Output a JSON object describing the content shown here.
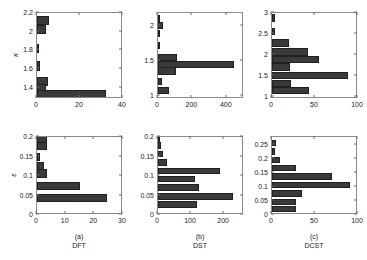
{
  "figure": {
    "layout": "2 rows x 3 columns of horizontal bar histograms",
    "columns": [
      {
        "key": "dft",
        "caption_index": "(a)",
        "caption_name": "DFT"
      },
      {
        "key": "dst",
        "caption_index": "(b)",
        "caption_name": "DST"
      },
      {
        "key": "dcst",
        "caption_index": "(c)",
        "caption_name": "DCST"
      }
    ],
    "row_labels": {
      "top": "κ",
      "bottom": "ε"
    }
  },
  "chart_data": [
    {
      "id": "panel-a-top",
      "type": "bar",
      "orientation": "horizontal",
      "title": "",
      "xlabel": "",
      "ylabel": "κ",
      "xlim": [
        0,
        40
      ],
      "ylim": [
        1.28,
        2.2
      ],
      "xticks": [
        0,
        20,
        40
      ],
      "xticklabels": [
        "0",
        "20",
        "40"
      ],
      "yticks": [
        1.4,
        1.6,
        1.8,
        2.0,
        2.2
      ],
      "yticklabels": [
        "1.4",
        "1.6",
        "1.8",
        "2",
        "2.2"
      ],
      "grid": false,
      "categories": [
        2.12,
        2.02,
        1.81,
        1.62,
        1.45,
        1.37,
        1.31
      ],
      "values": [
        5.5,
        4.5,
        0.8,
        1.5,
        5.0,
        4.5,
        33.0
      ]
    },
    {
      "id": "panel-b-top",
      "type": "bar",
      "orientation": "horizontal",
      "title": "",
      "xlabel": "",
      "ylabel": "",
      "xlim": [
        0,
        500
      ],
      "ylim": [
        0.95,
        2.18
      ],
      "xticks": [
        0,
        200,
        400
      ],
      "xticklabels": [
        "0",
        "200",
        "400"
      ],
      "yticks": [
        1.0,
        1.5,
        2.0
      ],
      "yticklabels": [
        "1",
        "1.5",
        "2"
      ],
      "grid": false,
      "categories": [
        2.1,
        2.0,
        1.88,
        1.7,
        1.53,
        1.43,
        1.33,
        1.18,
        1.05
      ],
      "values": [
        12,
        30,
        4,
        6,
        112,
        455,
        110,
        22,
        65
      ]
    },
    {
      "id": "panel-c-top",
      "type": "bar",
      "orientation": "horizontal",
      "title": "",
      "xlabel": "",
      "ylabel": "",
      "xlim": [
        0,
        100
      ],
      "ylim": [
        0.95,
        3.0
      ],
      "xticks": [
        0,
        50,
        100
      ],
      "xticklabels": [
        "0",
        "50",
        "100"
      ],
      "yticks": [
        1.0,
        1.5,
        2.0,
        2.5,
        3.0
      ],
      "yticklabels": [
        "1",
        "1.5",
        "2",
        "2.5",
        "3"
      ],
      "grid": false,
      "categories": [
        2.88,
        2.55,
        2.27,
        2.05,
        1.87,
        1.68,
        1.48,
        1.28,
        1.1
      ],
      "values": [
        3,
        3,
        20,
        43,
        56,
        22,
        90,
        23,
        44
      ]
    },
    {
      "id": "panel-a-bottom",
      "type": "bar",
      "orientation": "horizontal",
      "title": "",
      "xlabel": "DFT",
      "ylabel": "ε",
      "xlim": [
        0,
        30
      ],
      "ylim": [
        0,
        0.2
      ],
      "xticks": [
        0,
        10,
        20,
        30
      ],
      "xticklabels": [
        "0",
        "10",
        "20",
        "30"
      ],
      "yticks": [
        0,
        0.05,
        0.1,
        0.15,
        0.2
      ],
      "yticklabels": [
        "0",
        "0.05",
        "0.1",
        "0.15",
        "0.2"
      ],
      "grid": false,
      "categories": [
        0.193,
        0.176,
        0.148,
        0.124,
        0.104,
        0.071,
        0.04
      ],
      "values": [
        3.6,
        3.6,
        0.9,
        2.6,
        3.5,
        15.5,
        25.0
      ]
    },
    {
      "id": "panel-b-bottom",
      "type": "bar",
      "orientation": "horizontal",
      "title": "",
      "xlabel": "DST",
      "ylabel": "",
      "xlim": [
        0,
        260
      ],
      "ylim": [
        0,
        0.2
      ],
      "xticks": [
        0,
        100,
        200
      ],
      "xticklabels": [
        "0",
        "100",
        "200"
      ],
      "yticks": [
        0,
        0.05,
        0.1,
        0.15,
        0.2
      ],
      "yticklabels": [
        "0",
        "0.05",
        "0.1",
        "0.15",
        "0.2"
      ],
      "grid": false,
      "categories": [
        0.196,
        0.178,
        0.155,
        0.133,
        0.111,
        0.089,
        0.067,
        0.044,
        0.022
      ],
      "values": [
        3,
        10,
        17,
        27,
        192,
        113,
        127,
        232,
        122
      ]
    },
    {
      "id": "panel-c-bottom",
      "type": "bar",
      "orientation": "horizontal",
      "title": "",
      "xlabel": "DCST",
      "ylabel": "",
      "xlim": [
        0,
        100
      ],
      "ylim": [
        0,
        0.28
      ],
      "xticks": [
        0,
        50,
        100
      ],
      "xticklabels": [
        "0",
        "50",
        "100"
      ],
      "yticks": [
        0,
        0.05,
        0.1,
        0.15,
        0.2,
        0.25
      ],
      "yticklabels": [
        "0",
        "0.05",
        "0.1",
        "0.15",
        "0.2",
        "0.25"
      ],
      "grid": false,
      "categories": [
        0.258,
        0.227,
        0.196,
        0.165,
        0.134,
        0.103,
        0.072,
        0.041,
        0.015
      ],
      "values": [
        5,
        4,
        10,
        29,
        72,
        93,
        36,
        29,
        28
      ]
    }
  ],
  "style": {
    "bar_color": "#3a3a3a",
    "axis_color": "#8a8a8a",
    "text_color": "#1a1a1a",
    "background": "#ffffff"
  }
}
